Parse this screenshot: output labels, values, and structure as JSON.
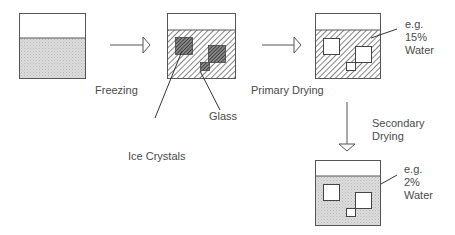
{
  "diagram": {
    "title": "",
    "stages": [
      {
        "id": "solution",
        "description": "Vial with liquid solution"
      },
      {
        "id": "frozen",
        "description": "Frozen: ice crystals in glass matrix"
      },
      {
        "id": "primary-dried",
        "description": "After primary drying: pores where ice was",
        "annotation": [
          "e.g.",
          "15%",
          "Water"
        ]
      },
      {
        "id": "secondary-dried",
        "description": "After secondary drying",
        "annotation": [
          "e.g.",
          "2%",
          "Water"
        ]
      }
    ],
    "transitions": [
      {
        "from": "solution",
        "to": "frozen",
        "label": "Freezing"
      },
      {
        "from": "frozen",
        "to": "primary-dried",
        "label": "Primary Drying"
      },
      {
        "from": "primary-dried",
        "to": "secondary-dried",
        "label": [
          "Secondary",
          "Drying"
        ]
      }
    ],
    "callouts": {
      "glass": "Glass",
      "ice_crystals": "Ice Crystals"
    },
    "colors": {
      "outline": "#555555",
      "liquid_fill": "#d9d9d9",
      "hatch": "#666666",
      "dense_hatch": "#333333",
      "text": "#4a4a4a"
    }
  }
}
